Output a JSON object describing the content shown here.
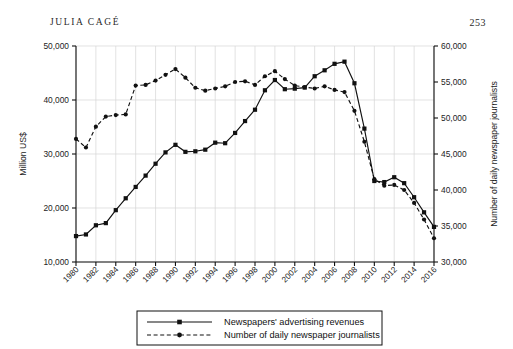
{
  "header": {
    "running_head": "JULIA CAGÉ",
    "page_number": "253"
  },
  "chart_data": {
    "type": "line",
    "title": "",
    "xlabel": "",
    "grid": true,
    "legend_position": "bottom",
    "x": [
      1980,
      1981,
      1982,
      1983,
      1984,
      1985,
      1986,
      1987,
      1988,
      1989,
      1990,
      1991,
      1992,
      1993,
      1994,
      1995,
      1996,
      1997,
      1998,
      1999,
      2000,
      2001,
      2002,
      2003,
      2004,
      2005,
      2006,
      2007,
      2008,
      2009,
      2010,
      2011,
      2012,
      2013,
      2014,
      2015,
      2016
    ],
    "xtick_labels": [
      "1980",
      "1982",
      "1984",
      "1986",
      "1988",
      "1990",
      "1992",
      "1994",
      "1996",
      "1998",
      "2000",
      "2002",
      "2004",
      "2006",
      "2008",
      "2010",
      "2012",
      "2014",
      "2016"
    ],
    "xlim": [
      1980,
      2016
    ],
    "left_axis": {
      "label": "Million US$",
      "ylim": [
        10000,
        50000
      ],
      "ticks": [
        10000,
        20000,
        30000,
        40000,
        50000
      ],
      "tick_labels": [
        "10,000",
        "20,000",
        "30,000",
        "40,000",
        "50,000"
      ]
    },
    "right_axis": {
      "label": "Number of daily newspaper journalists",
      "ylim": [
        30000,
        60000
      ],
      "ticks": [
        30000,
        35000,
        40000,
        45000,
        50000,
        55000,
        60000
      ],
      "tick_labels": [
        "30,000",
        "35,000",
        "40,000",
        "45,000",
        "50,000",
        "55,000",
        "60,000"
      ]
    },
    "series": [
      {
        "name": "Newspapers' advertising revenues",
        "axis": "left",
        "style": "solid",
        "marker": "square",
        "color": "#111111",
        "values": [
          14800,
          15100,
          16800,
          17200,
          19600,
          21800,
          23900,
          26000,
          28200,
          30300,
          31700,
          30400,
          30500,
          30800,
          32100,
          32000,
          33900,
          36100,
          38200,
          41800,
          43700,
          42000,
          42100,
          42300,
          44400,
          45500,
          46700,
          47100,
          43100,
          34700,
          25000,
          24800,
          25700,
          24600,
          22000,
          19200,
          16500
        ]
      },
      {
        "name": "Number of daily newspaper journalists",
        "axis": "right",
        "style": "dashed",
        "marker": "circle",
        "color": "#111111",
        "values": [
          47100,
          45900,
          48800,
          50200,
          50400,
          50500,
          54500,
          54600,
          55200,
          56000,
          56800,
          55600,
          54200,
          53800,
          54100,
          54400,
          55000,
          55100,
          54600,
          55800,
          56500,
          55400,
          54500,
          54300,
          54100,
          54400,
          53900,
          53600,
          51000,
          46700,
          41500,
          40600,
          40700,
          40000,
          38200,
          35900,
          33300
        ]
      }
    ]
  },
  "legend": {
    "items": [
      {
        "label": "Newspapers' advertising revenues",
        "style": "solid",
        "marker": "square"
      },
      {
        "label": "Number of daily newspaper journalists",
        "style": "dashed",
        "marker": "circle"
      }
    ]
  }
}
